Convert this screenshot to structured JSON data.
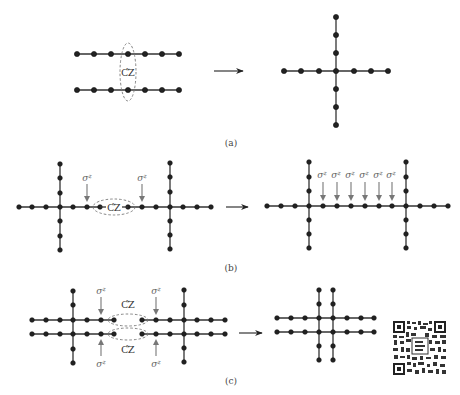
{
  "figure": {
    "panels": [
      {
        "id": "a",
        "label": "(a)",
        "description": "Two linear chains joined by a CZ gate become a cross-shaped cluster",
        "gate_label": "CZ",
        "gate_label_has_tilde": true,
        "left": {
          "chains": 2,
          "nodes_per_chain": 7
        },
        "right": {
          "shape": "cross",
          "horizontal_nodes": 7,
          "vertical_nodes": 7
        }
      },
      {
        "id": "b",
        "label": "(b)",
        "description": "Two crosses connected via CZ with sigma-z measurements yields a longer two-cross cluster",
        "gate_label": "CZ",
        "gate_label_has_tilde": true,
        "measurement_label": "σ",
        "measurement_superscript": "z",
        "left_measurements": 2,
        "right_measurements": 6
      },
      {
        "id": "c",
        "label": "(c)",
        "description": "Two double-row clusters fused by two CZ gates with sigma-z measurements yields a grid cluster",
        "gate_label": "CZ",
        "gate_label_has_tilde": true,
        "gate_count": 2,
        "measurement_label": "σ",
        "measurement_superscript": "z",
        "left_measurements": 4
      }
    ],
    "qr_code": {
      "present": true,
      "icon": "qr-code-icon"
    },
    "colors": {
      "node": "#222222",
      "edge": "#333333",
      "dashed_ellipse": "#777777",
      "measurement_arrow": "#777777",
      "background": "#ffffff"
    }
  }
}
